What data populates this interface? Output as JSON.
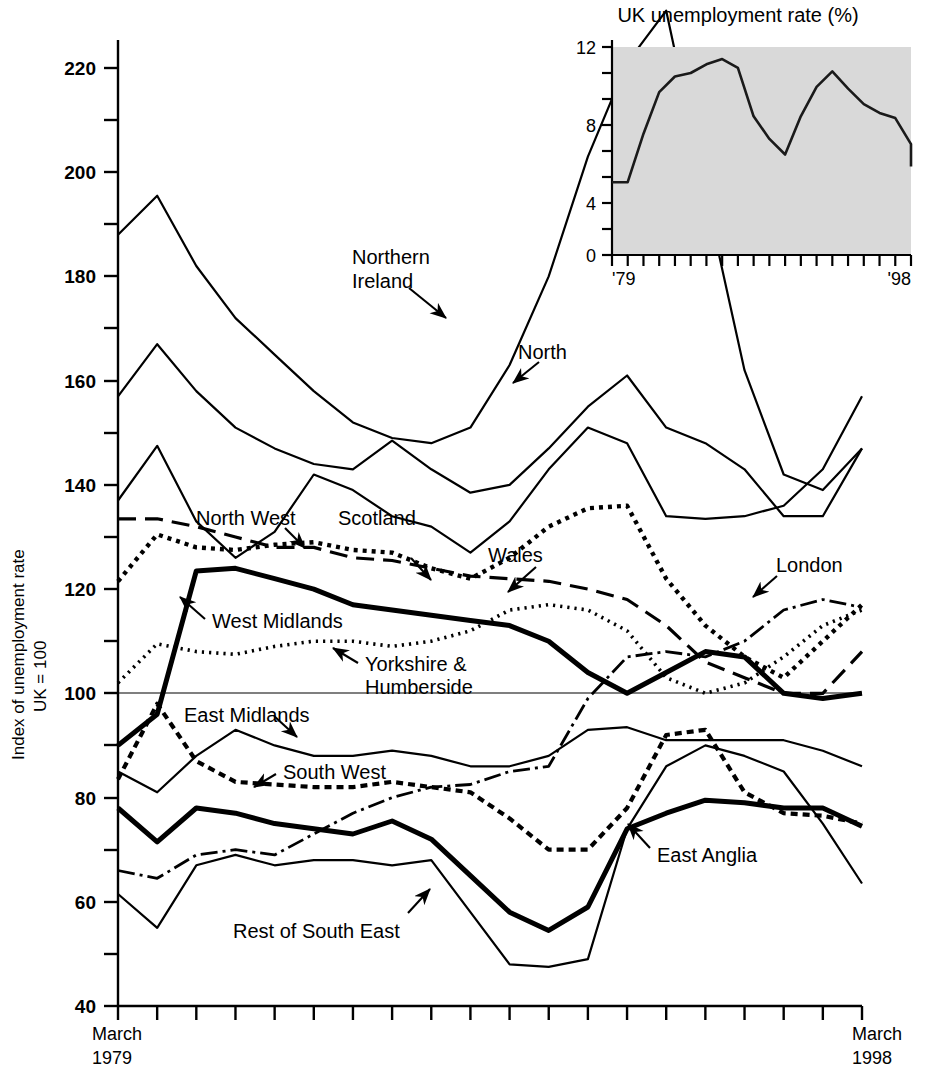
{
  "figure": {
    "ylabel_line1": "Index of unemployment rate",
    "ylabel_line2": "UK = 100",
    "xstart_line1": "March",
    "xstart_line2": "1979",
    "xend_line1": "March",
    "xend_line2": "1998"
  },
  "chart_data": {
    "type": "line",
    "title": "",
    "xlabel": "",
    "ylabel": "Index of unemployment rate UK = 100",
    "ylim": [
      40,
      232
    ],
    "xlim": [
      1979,
      1998
    ],
    "yticks": [
      40,
      60,
      80,
      100,
      120,
      140,
      160,
      180,
      200,
      220
    ],
    "ytick_labels": [
      "40",
      "60",
      "80",
      "100",
      "120",
      "140",
      "160",
      "180",
      "200",
      "220"
    ],
    "minor_yticks": [
      50,
      70,
      90,
      110,
      130,
      150,
      170,
      190,
      210,
      230
    ],
    "grid": false,
    "reference_line": 100,
    "legend": "inline-annotations",
    "x": [
      1979,
      1980,
      1981,
      1982,
      1983,
      1984,
      1985,
      1986,
      1987,
      1988,
      1989,
      1990,
      1991,
      1992,
      1993,
      1994,
      1995,
      1996,
      1997,
      1998
    ],
    "series": [
      {
        "name": "Northern Ireland",
        "style": "solid-thin",
        "label_x": 352,
        "label_y": 262,
        "values": [
          188,
          195.5,
          182,
          172,
          165,
          158,
          152,
          149,
          148,
          151,
          163,
          180,
          203,
          221,
          231,
          196,
          162,
          142,
          139,
          147
        ]
      },
      {
        "name": "North",
        "style": "solid-thin",
        "label_x": 520,
        "label_y": 352,
        "values": [
          157,
          167,
          158,
          151,
          147,
          144,
          143,
          148.5,
          143,
          138.5,
          140,
          147,
          155,
          161,
          151,
          148,
          143,
          134,
          134,
          147
        ]
      },
      {
        "name": "North-2",
        "style": "solid-thin",
        "label_x": null,
        "label_y": null,
        "values": [
          137,
          147.5,
          133,
          126,
          131,
          142,
          139,
          134,
          132,
          127,
          133,
          143,
          151,
          148,
          134,
          133.5,
          134,
          136,
          143,
          157
        ]
      },
      {
        "name": "Wales",
        "style": "dashed-long",
        "label_x": 487,
        "label_y": 556,
        "values": [
          133.5,
          133.5,
          132,
          130,
          128,
          128,
          126,
          125.5,
          124,
          122.5,
          122,
          121.5,
          120,
          118,
          113,
          106,
          103,
          100,
          100,
          108
        ]
      },
      {
        "name": "North West",
        "style": "dotted-thick",
        "label_x": 199,
        "label_y": 520,
        "values": [
          121.5,
          130.5,
          128,
          127.5,
          128.5,
          129,
          127.5,
          127,
          124,
          122,
          126,
          132,
          135.5,
          136,
          122,
          113,
          107,
          103,
          110,
          117
        ]
      },
      {
        "name": "Scotland",
        "style": "solid-thin",
        "label_x": 338,
        "label_y": 550,
        "values": [
          137,
          147.5,
          133,
          126,
          131,
          142,
          139,
          134,
          132,
          127,
          133,
          143,
          151,
          148,
          134,
          133.5,
          134,
          136,
          143,
          157
        ]
      },
      {
        "name": "West Midlands",
        "style": "solid-thick",
        "label_x": 214,
        "label_y": 624,
        "values": [
          90,
          96,
          123.5,
          124,
          122,
          120,
          117,
          116,
          115,
          114,
          113,
          110,
          104,
          100,
          104,
          108,
          107,
          100,
          99,
          100
        ]
      },
      {
        "name": "Yorkshire & Humberside",
        "style": "dotted-fine",
        "label_x": 364,
        "label_y": 663,
        "values": [
          102,
          109.5,
          108,
          107.5,
          109,
          110,
          110,
          109,
          110,
          112,
          116,
          117,
          116,
          112,
          103,
          100,
          102,
          107,
          113,
          116
        ]
      },
      {
        "name": "East Midlands",
        "style": "solid-thin",
        "label_x": 185,
        "label_y": 712,
        "values": [
          85,
          81,
          88,
          93,
          90,
          88,
          88,
          89,
          88,
          86,
          86,
          88,
          93,
          93.5,
          91,
          91,
          91,
          91,
          89,
          86
        ]
      },
      {
        "name": "South West",
        "style": "dashed-short",
        "label_x": 285,
        "label_y": 770,
        "values": [
          83.5,
          98,
          87,
          83,
          82.5,
          82,
          82,
          83,
          82,
          81,
          76,
          70,
          70,
          78,
          92,
          93,
          81,
          77,
          76.5,
          75
        ]
      },
      {
        "name": "East Anglia",
        "style": "solid-thick",
        "label_x": 656,
        "label_y": 855,
        "values": [
          78,
          71.5,
          78,
          77,
          75,
          74,
          73,
          75.5,
          72,
          65,
          58,
          54.5,
          59,
          74,
          77,
          79.5,
          79,
          78,
          78,
          74.5
        ]
      },
      {
        "name": "London",
        "style": "dash-dot",
        "label_x": 774,
        "label_y": 565,
        "values": [
          66,
          64.5,
          69,
          70,
          69,
          73,
          77,
          80,
          82,
          82.5,
          85,
          86,
          99,
          107,
          108,
          107,
          110,
          116,
          118,
          116.5
        ]
      },
      {
        "name": "Rest of South East",
        "style": "solid-thin",
        "label_x": 234,
        "label_y": 930,
        "values": [
          61.5,
          55,
          67,
          69,
          67,
          68,
          68,
          67,
          68,
          58,
          48,
          47.5,
          49,
          74,
          86,
          90,
          88,
          85,
          75,
          63.5
        ]
      }
    ],
    "annotations": [
      {
        "text": "Northern Ireland",
        "type": "series-label"
      },
      {
        "text": "North",
        "type": "series-label"
      },
      {
        "text": "North West",
        "type": "series-label"
      },
      {
        "text": "Scotland",
        "type": "series-label"
      },
      {
        "text": "Wales",
        "type": "series-label"
      },
      {
        "text": "London",
        "type": "series-label"
      },
      {
        "text": "West Midlands",
        "type": "series-label"
      },
      {
        "text": "Yorkshire & Humberside",
        "type": "series-label"
      },
      {
        "text": "East Midlands",
        "type": "series-label"
      },
      {
        "text": "South West",
        "type": "series-label"
      },
      {
        "text": "East Anglia",
        "type": "series-label"
      },
      {
        "text": "Rest of South East",
        "type": "series-label"
      }
    ]
  },
  "inset_chart_data": {
    "type": "line",
    "title": "UK unemployment rate (%)",
    "xlabel": "",
    "ylabel": "",
    "ylim": [
      0,
      12
    ],
    "yticks": [
      0,
      4,
      8,
      12
    ],
    "ytick_labels": [
      "0",
      "4",
      "8",
      "12"
    ],
    "xtick_labels": [
      "'79",
      "'98"
    ],
    "plot_background": "#d9d9d9",
    "grid": false,
    "x": [
      1979,
      1980,
      1981,
      1982,
      1983,
      1984,
      1985,
      1986,
      1987,
      1988,
      1989,
      1990,
      1991,
      1992,
      1993,
      1994,
      1995,
      1996,
      1997,
      1998
    ],
    "values": [
      4.2,
      4.2,
      7.0,
      9.4,
      10.3,
      10.5,
      11.0,
      11.3,
      10.8,
      8.0,
      6.7,
      5.8,
      8.0,
      9.7,
      10.6,
      9.6,
      8.7,
      8.2,
      7.9,
      6.4
    ],
    "values_note": "final point 5.1"
  },
  "labels": {
    "northern_ireland": "Northern\nIreland",
    "northern_ireland_1": "Northern",
    "northern_ireland_2": "Ireland",
    "north": "North",
    "north_west": "North West",
    "scotland": "Scotland",
    "wales": "Wales",
    "london": "London",
    "west_midlands": "West Midlands",
    "yorkshire_1": "Yorkshire &",
    "yorkshire_2": "Humberside",
    "east_midlands": "East Midlands",
    "south_west": "South West",
    "east_anglia": "East Anglia",
    "rest_of_south_east": "Rest of South East"
  },
  "inset_labels": {
    "title": "UK unemployment rate (%)",
    "y12": "12",
    "y8": "8",
    "y4": "4",
    "y0": "0",
    "x_start": "'79",
    "x_end": "'98"
  },
  "yticks": {
    "t220": "220",
    "t200": "200",
    "t180": "180",
    "t160": "160",
    "t140": "140",
    "t120": "120",
    "t100": "100",
    "t80": "80",
    "t60": "60",
    "t40": "40"
  }
}
